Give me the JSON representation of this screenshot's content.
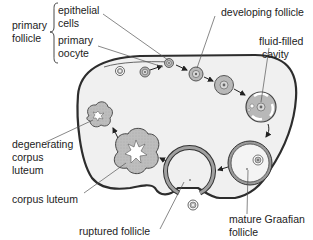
{
  "diagram": {
    "colors": {
      "ovary_fill": "#efefef",
      "ovary_outline": "#333333",
      "follicle_fill": "#b8b8b8",
      "text": "#222222"
    },
    "labels": {
      "primary_follicle": [
        "primary",
        "follicle"
      ],
      "epithelial_cells": [
        "epithelial",
        "cells"
      ],
      "primary_oocyte": [
        "primary",
        "oocyte"
      ],
      "developing_follicle": "developing follicle",
      "fluid_filled_cavity": [
        "fluid-filled",
        "cavity"
      ],
      "degenerating_corpus_luteum": [
        "degenerating",
        "corpus",
        "luteum"
      ],
      "corpus_luteum": "corpus luteum",
      "ruptured_follicle": "ruptured follicle",
      "mature_graafian_follicle": [
        "mature Graafian",
        "follicle"
      ]
    }
  }
}
